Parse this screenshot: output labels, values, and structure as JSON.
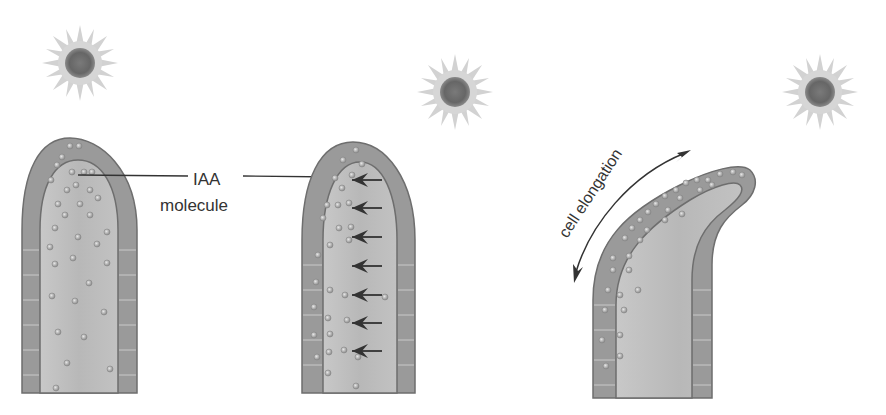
{
  "diagram": {
    "labels": {
      "iaa": "IAA",
      "molecule": "molecule",
      "cell_elongation": "cell elongation"
    },
    "panels": [
      {
        "id": "panel-1",
        "description": "Light source upper-left; IAA molecules evenly distributed in shoot tip"
      },
      {
        "id": "panel-2",
        "description": "Light source upper-right; arrows show IAA migrating to shaded (left) side"
      },
      {
        "id": "panel-3",
        "description": "Light source upper-right; shaded side cells elongate, shoot bends toward light"
      }
    ],
    "icons": {
      "light_source": "sun-icon",
      "migration_arrow": "arrow-left-icon",
      "elongation_arrow": "double-headed-curved-arrow-icon"
    },
    "colors": {
      "background": "#ffffff",
      "outer_tissue": "#9a9a9a",
      "inner_tissue": "#bdbdbd",
      "outline": "#6e6e6e",
      "molecule": "#a8a8a8",
      "sun_core": "#6d6d6d",
      "sun_rays": "#cfcfcf",
      "arrow": "#333333",
      "text": "#333333"
    }
  }
}
